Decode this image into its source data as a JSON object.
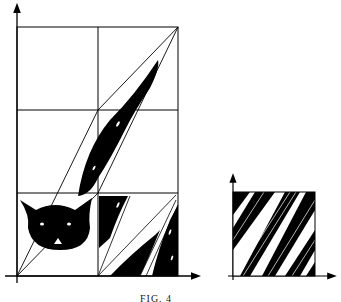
{
  "figure": {
    "caption": "FIG. 4",
    "colors": {
      "ink": "#000000",
      "paper": "#ffffff"
    }
  }
}
